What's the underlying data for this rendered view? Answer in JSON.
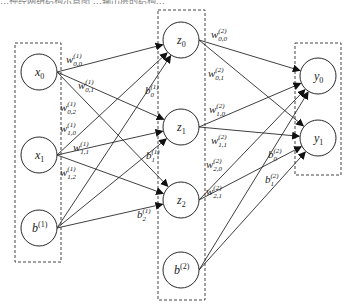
{
  "caption": "…神经网络结构示意图 …输出层的结构…",
  "layers": {
    "input": {
      "nodes": [
        {
          "id": "x0",
          "base": "x",
          "sub": "0",
          "sup": "",
          "cx": 39,
          "cy": 72
        },
        {
          "id": "x1",
          "base": "x",
          "sub": "1",
          "sup": "",
          "cx": 39,
          "cy": 155
        },
        {
          "id": "b1",
          "base": "b",
          "sub": "",
          "sup": "(1)",
          "cx": 39,
          "cy": 228
        }
      ],
      "box": {
        "x": 15,
        "y": 43,
        "w": 46,
        "h": 219
      }
    },
    "hidden": {
      "nodes": [
        {
          "id": "z0",
          "base": "z",
          "sub": "0",
          "sup": "",
          "cx": 181,
          "cy": 40
        },
        {
          "id": "z1",
          "base": "z",
          "sub": "1",
          "sup": "",
          "cx": 181,
          "cy": 127
        },
        {
          "id": "z2",
          "base": "z",
          "sub": "2",
          "sup": "",
          "cx": 181,
          "cy": 200
        },
        {
          "id": "b2",
          "base": "b",
          "sub": "",
          "sup": "(2)",
          "cx": 181,
          "cy": 270
        }
      ],
      "box": {
        "x": 158,
        "y": 10,
        "w": 47,
        "h": 290
      }
    },
    "output": {
      "nodes": [
        {
          "id": "y0",
          "base": "y",
          "sub": "0",
          "sup": "",
          "cx": 318,
          "cy": 76
        },
        {
          "id": "y1",
          "base": "y",
          "sub": "1",
          "sup": "",
          "cx": 318,
          "cy": 138
        }
      ],
      "box": {
        "x": 295,
        "y": 43,
        "w": 46,
        "h": 132
      }
    }
  },
  "edges": [
    [
      "x0",
      "z0"
    ],
    [
      "x0",
      "z1"
    ],
    [
      "x0",
      "z2"
    ],
    [
      "x1",
      "z0"
    ],
    [
      "x1",
      "z1"
    ],
    [
      "x1",
      "z2"
    ],
    [
      "b1",
      "z0"
    ],
    [
      "b1",
      "z1"
    ],
    [
      "b1",
      "z2"
    ],
    [
      "z0",
      "y0"
    ],
    [
      "z0",
      "y1"
    ],
    [
      "z1",
      "y0"
    ],
    [
      "z1",
      "y1"
    ],
    [
      "z2",
      "y0"
    ],
    [
      "z2",
      "y1"
    ],
    [
      "b2",
      "y0"
    ],
    [
      "b2",
      "y1"
    ]
  ],
  "edge_labels": [
    {
      "base": "w",
      "sup": "(1)",
      "sub": "0,0",
      "x": 66,
      "y": 52
    },
    {
      "base": "w",
      "sup": "(1)",
      "sub": "0,1",
      "x": 78,
      "y": 78
    },
    {
      "base": "w",
      "sup": "(1)",
      "sub": "0,2",
      "x": 60,
      "y": 100
    },
    {
      "base": "w",
      "sup": "(1)",
      "sub": "1,0",
      "x": 60,
      "y": 121
    },
    {
      "base": "w",
      "sup": "(1)",
      "sub": "1,1",
      "x": 73,
      "y": 140
    },
    {
      "base": "w",
      "sup": "(1)",
      "sub": "1,2",
      "x": 60,
      "y": 165
    },
    {
      "base": "b",
      "sup": "(1)",
      "sub": "0",
      "x": 145,
      "y": 83
    },
    {
      "base": "b",
      "sup": "(1)",
      "sub": "1",
      "x": 146,
      "y": 148
    },
    {
      "base": "b",
      "sup": "(1)",
      "sub": "2",
      "x": 137,
      "y": 207
    },
    {
      "base": "w",
      "sup": "(2)",
      "sub": "0,0",
      "x": 211,
      "y": 27
    },
    {
      "base": "w",
      "sup": "(2)",
      "sub": "0,1",
      "x": 208,
      "y": 66
    },
    {
      "base": "w",
      "sup": "(2)",
      "sub": "1,0",
      "x": 209,
      "y": 102
    },
    {
      "base": "w",
      "sup": "(2)",
      "sub": "1,1",
      "x": 211,
      "y": 133
    },
    {
      "base": "w",
      "sup": "(2)",
      "sub": "2,0",
      "x": 206,
      "y": 157
    },
    {
      "base": "w",
      "sup": "(2)",
      "sub": "2,1",
      "x": 206,
      "y": 184
    },
    {
      "base": "b",
      "sup": "(2)",
      "sub": "0",
      "x": 268,
      "y": 147
    },
    {
      "base": "b",
      "sup": "(2)",
      "sub": "1",
      "x": 265,
      "y": 172
    }
  ],
  "style": {
    "stroke": "#2a2a2a",
    "box_stroke": "#444444",
    "node_radius": 18
  }
}
